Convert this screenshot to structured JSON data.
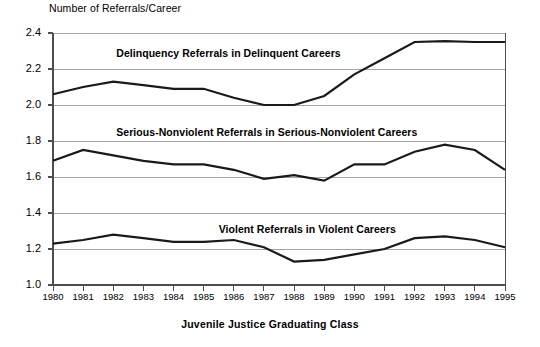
{
  "chart_data": {
    "type": "line",
    "title": "",
    "xlabel": "Juvenile Justice Graduating Class",
    "ylabel": "Number of Referrals/Career",
    "categories": [
      "1980",
      "1981",
      "1982",
      "1983",
      "1984",
      "1985",
      "1986",
      "1987",
      "1988",
      "1989",
      "1990",
      "1991",
      "1992",
      "1993",
      "1994",
      "1995"
    ],
    "x": [
      1980,
      1981,
      1982,
      1983,
      1984,
      1985,
      1986,
      1987,
      1988,
      1989,
      1990,
      1991,
      1992,
      1993,
      1994,
      1995
    ],
    "xlim": [
      1980,
      1995
    ],
    "ylim": [
      1.0,
      2.4
    ],
    "yticks": [
      "1.0",
      "1.2",
      "1.4",
      "1.6",
      "1.8",
      "2.0",
      "2.2",
      "2.4"
    ],
    "ytick_values": [
      1.0,
      1.2,
      1.4,
      1.6,
      1.8,
      2.0,
      2.2,
      2.4
    ],
    "grid": "horizontal",
    "legend": "inline-labels",
    "line_color": "#1a1a1a",
    "grid_color": "#9a9a9a",
    "axis_color": "#4d4d4d",
    "series": [
      {
        "name": "Delinquency Referrals in Delinquent Careers",
        "label_x": 1982.1,
        "label_y": 2.285,
        "values": [
          2.06,
          2.1,
          2.13,
          2.11,
          2.09,
          2.09,
          2.04,
          2.0,
          2.0,
          2.05,
          2.17,
          2.26,
          2.35,
          2.355,
          2.35,
          2.35
        ]
      },
      {
        "name": "Serious-Nonviolent Referrals in Serious-Nonviolent Careers",
        "label_x": 1982.1,
        "label_y": 1.845,
        "values": [
          1.69,
          1.75,
          1.72,
          1.69,
          1.67,
          1.67,
          1.64,
          1.59,
          1.61,
          1.58,
          1.67,
          1.67,
          1.74,
          1.78,
          1.75,
          1.64
        ]
      },
      {
        "name": "Violent Referrals in Violent Careers",
        "label_x": 1985.5,
        "label_y": 1.305,
        "values": [
          1.23,
          1.25,
          1.28,
          1.26,
          1.24,
          1.24,
          1.25,
          1.21,
          1.13,
          1.14,
          1.17,
          1.2,
          1.26,
          1.27,
          1.25,
          1.21
        ]
      }
    ]
  }
}
